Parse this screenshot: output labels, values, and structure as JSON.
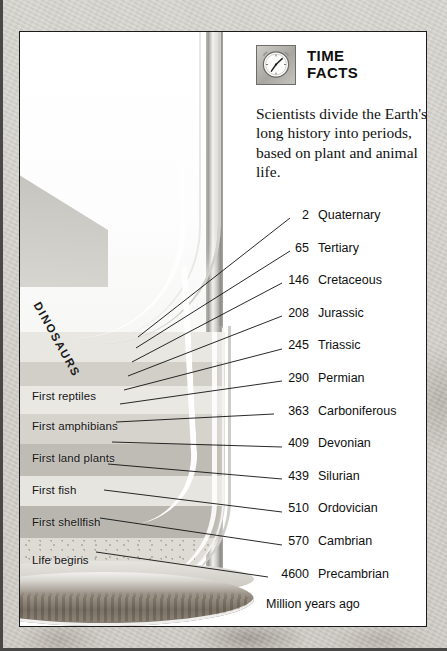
{
  "panel": {
    "header": {
      "icon": "clock-icon",
      "title_line1": "TIME",
      "title_line2": "FACTS"
    },
    "intro": "Scientists divide the Earth's long history into periods, based on plant and animal life.",
    "footnote": "Million years ago",
    "units_note": "Million years ago"
  },
  "hourglass": {
    "dinosaurs_label": "DINOSAURS",
    "era_labels": [
      {
        "text": "First reptiles",
        "top": 358
      },
      {
        "text": "First amphibians",
        "top": 388
      },
      {
        "text": "First land plants",
        "top": 420
      },
      {
        "text": "First fish",
        "top": 452
      },
      {
        "text": "First shellfish",
        "top": 484
      },
      {
        "text": "Life begins",
        "top": 522
      }
    ],
    "sand_bands": [
      {
        "top": 300,
        "height": 30,
        "color": "#e9e7e2"
      },
      {
        "top": 330,
        "height": 24,
        "color": "#d2cfc9"
      },
      {
        "top": 354,
        "height": 28,
        "color": "#eae8e3"
      },
      {
        "top": 382,
        "height": 30,
        "color": "#d6d3cd"
      },
      {
        "top": 412,
        "height": 32,
        "color": "#bfbcb5"
      },
      {
        "top": 444,
        "height": 30,
        "color": "#e7e5e0"
      },
      {
        "top": 474,
        "height": 32,
        "color": "#b9b6af"
      },
      {
        "top": 506,
        "height": 54,
        "color": "#dedbd5"
      }
    ]
  },
  "periods": [
    {
      "mya": "2",
      "name": "Quaternary",
      "leader": {
        "x1": 118,
        "y1": 305,
        "x2": 270,
        "y2": 186
      }
    },
    {
      "mya": "65",
      "name": "Tertiary",
      "leader": {
        "x1": 116,
        "y1": 316,
        "x2": 270,
        "y2": 219
      }
    },
    {
      "mya": "146",
      "name": "Cretaceous",
      "leader": {
        "x1": 112,
        "y1": 330,
        "x2": 262,
        "y2": 251
      }
    },
    {
      "mya": "208",
      "name": "Jurassic",
      "leader": {
        "x1": 108,
        "y1": 344,
        "x2": 262,
        "y2": 284
      }
    },
    {
      "mya": "245",
      "name": "Triassic",
      "leader": {
        "x1": 104,
        "y1": 358,
        "x2": 262,
        "y2": 317
      }
    },
    {
      "mya": "290",
      "name": "Permian",
      "leader": {
        "x1": 100,
        "y1": 372,
        "x2": 262,
        "y2": 349
      }
    },
    {
      "mya": "363",
      "name": "Carboniferous",
      "leader": {
        "x1": 96,
        "y1": 390,
        "x2": 254,
        "y2": 382
      }
    },
    {
      "mya": "409",
      "name": "Devonian",
      "leader": {
        "x1": 92,
        "y1": 410,
        "x2": 262,
        "y2": 415
      }
    },
    {
      "mya": "439",
      "name": "Silurian",
      "leader": {
        "x1": 88,
        "y1": 432,
        "x2": 262,
        "y2": 447
      }
    },
    {
      "mya": "510",
      "name": "Ordovician",
      "leader": {
        "x1": 84,
        "y1": 458,
        "x2": 262,
        "y2": 480
      }
    },
    {
      "mya": "570",
      "name": "Cambrian",
      "leader": {
        "x1": 80,
        "y1": 486,
        "x2": 262,
        "y2": 513
      }
    },
    {
      "mya": "4600",
      "name": "Precambrian",
      "leader": {
        "x1": 76,
        "y1": 520,
        "x2": 248,
        "y2": 545
      }
    }
  ],
  "colors": {
    "panel_background": "#ffffff",
    "panel_border": "#1b1b1b",
    "text": "#101010",
    "page_background": "#d2cfca",
    "sand_light": "#e9e7e2",
    "sand_dark": "#b9b6af",
    "base_wood": "#6f665c"
  }
}
